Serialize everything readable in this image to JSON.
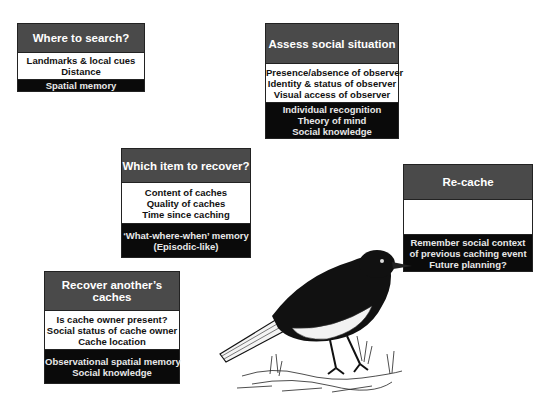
{
  "boxes": {
    "where": {
      "title": "Where to search?",
      "factors": [
        "Landmarks & local cues",
        "Distance"
      ],
      "cognition": [
        "Spatial memory"
      ]
    },
    "assess": {
      "title": "Assess social situation",
      "factors": [
        "Presence/absence of observer",
        "Identity & status of observer",
        "Visual access of observer"
      ],
      "cognition": [
        "Individual recognition",
        "Theory of mind",
        "Social knowledge"
      ]
    },
    "which": {
      "title": "Which item to recover?",
      "factors": [
        "Content of caches",
        "Quality of caches",
        "Time since caching"
      ],
      "cognition": [
        "‘What-where-when’  memory",
        "(Episodic-like)"
      ]
    },
    "recache": {
      "title": "Re-cache",
      "factors": [],
      "cognition": [
        "Remember social context",
        "of previous caching event",
        "Future planning?"
      ]
    },
    "recover": {
      "title": "Recover another’s caches",
      "factors": [
        "Is cache owner present?",
        "Social status of cache owner",
        "Cache location"
      ],
      "cognition": [
        "Observational spatial memory",
        "Social knowledge"
      ]
    }
  },
  "illustration": {
    "subject": "scrub-jay bird sketch"
  }
}
